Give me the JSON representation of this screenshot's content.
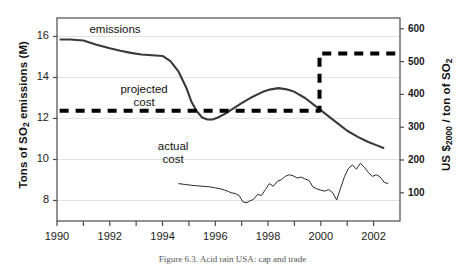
{
  "chart_data": {
    "type": "line",
    "title": "",
    "caption": "Figure 6.3. Acid rain USA: cap and trade",
    "xlabel": "",
    "xlim": [
      1990,
      2003
    ],
    "grid": true,
    "legend_position": "inline-annotations",
    "axes": {
      "left": {
        "title_prefix": "Tons of SO",
        "title_sub": "2",
        "title_suffix": " emissions (M)",
        "ticks": [
          8,
          10,
          12,
          14,
          16
        ],
        "range": [
          7.0,
          16.9
        ]
      },
      "right": {
        "title_prefix": "US $",
        "title_sub": "2000",
        "title_suffix": " / ton of SO",
        "title_sub2": "2",
        "ticks": [
          100,
          200,
          300,
          400,
          500,
          600
        ],
        "range": [
          14,
          633
        ]
      },
      "x": {
        "ticks": [
          1990,
          1992,
          1994,
          1996,
          1998,
          2000,
          2002
        ],
        "minor_ticks": [
          1991,
          1993,
          1995,
          1997,
          1999,
          2001
        ]
      }
    },
    "annotations": [
      {
        "name": "emissions-label",
        "text": "emissions",
        "x": 1992.2,
        "y_axis": "left",
        "y": 16.25
      },
      {
        "name": "projected-cost-label",
        "text": "projected",
        "x": 1993.3,
        "y_axis": "left",
        "y": 13.35
      },
      {
        "name": "projected-cost-label-2",
        "text": "cost",
        "x": 1993.3,
        "y_axis": "left",
        "y": 12.72
      },
      {
        "name": "actual-cost-label",
        "text": "actual",
        "x": 1994.4,
        "y_axis": "left",
        "y": 10.55
      },
      {
        "name": "actual-cost-label-2",
        "text": "cost",
        "x": 1994.4,
        "y_axis": "left",
        "y": 9.92
      }
    ],
    "series": [
      {
        "name": "emissions",
        "axis": "left",
        "style": "solid",
        "color": "#3a3a3a",
        "width": 2.1,
        "unit": "Tons of SO2 emissions (M)",
        "x": [
          1990.1,
          1990.5,
          1991.0,
          1991.5,
          1992.0,
          1992.4,
          1992.8,
          1993.2,
          1993.6,
          1994.0,
          1994.3,
          1994.6,
          1994.9,
          1995.1,
          1995.3,
          1995.5,
          1995.7,
          1995.9,
          1996.1,
          1996.4,
          1996.7,
          1997.0,
          1997.4,
          1997.8,
          1998.1,
          1998.4,
          1998.7,
          1999.0,
          1999.4,
          1999.8,
          2000.2,
          2000.6,
          2001.0,
          2001.4,
          2001.8,
          2002.1,
          2002.4
        ],
        "y": [
          15.85,
          15.85,
          15.8,
          15.6,
          15.42,
          15.3,
          15.2,
          15.12,
          15.08,
          15.05,
          14.8,
          14.3,
          13.5,
          12.8,
          12.35,
          12.05,
          11.95,
          11.95,
          12.05,
          12.25,
          12.5,
          12.75,
          13.05,
          13.3,
          13.42,
          13.48,
          13.42,
          13.3,
          13.0,
          12.6,
          12.2,
          11.8,
          11.4,
          11.1,
          10.85,
          10.7,
          10.55
        ]
      },
      {
        "name": "projected cost",
        "axis": "right",
        "style": "dashed",
        "color": "#000000",
        "width": 4.0,
        "unit": "US $2000 / ton of SO2",
        "x": [
          1990.1,
          1999.95,
          1999.95,
          2003.0
        ],
        "y": [
          350,
          350,
          525,
          525
        ]
      },
      {
        "name": "actual cost",
        "axis": "right",
        "style": "solid",
        "color": "#2b2b2b",
        "width": 1.0,
        "unit": "US $2000 / ton of SO2",
        "x": [
          1994.6,
          1994.9,
          1995.2,
          1995.5,
          1995.8,
          1996.0,
          1996.2,
          1996.35,
          1996.5,
          1996.6,
          1996.75,
          1996.9,
          1997.05,
          1997.2,
          1997.3,
          1997.45,
          1997.6,
          1997.75,
          1997.9,
          1998.05,
          1998.2,
          1998.35,
          1998.5,
          1998.65,
          1998.8,
          1998.95,
          1999.1,
          1999.25,
          1999.4,
          1999.55,
          1999.7,
          1999.85,
          2000.0,
          2000.15,
          2000.3,
          2000.45,
          2000.6,
          2000.75,
          2000.9,
          2001.05,
          2001.2,
          2001.35,
          2001.5,
          2001.65,
          2001.8,
          2001.95,
          2002.1,
          2002.25,
          2002.4,
          2002.55
        ],
        "y": [
          128,
          125,
          122,
          120,
          118,
          115,
          112,
          108,
          104,
          100,
          98,
          92,
          72,
          70,
          75,
          80,
          95,
          92,
          110,
          128,
          120,
          135,
          140,
          150,
          155,
          152,
          145,
          148,
          142,
          138,
          118,
          112,
          108,
          105,
          110,
          100,
          78,
          115,
          150,
          175,
          185,
          172,
          190,
          178,
          162,
          150,
          155,
          148,
          132,
          128
        ]
      }
    ]
  }
}
